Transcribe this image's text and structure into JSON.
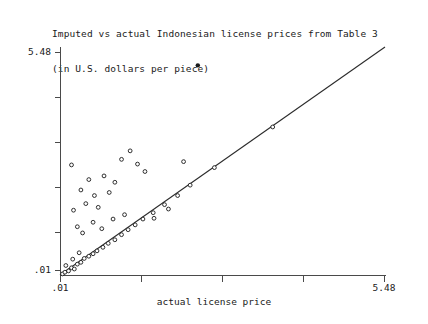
{
  "title": {
    "line1": "Imputed vs actual Indonesian license prices from Table 3",
    "line2": "(in U.S. dollars per piece)"
  },
  "axes": {
    "x_label": "actual license price",
    "y_min_label": ".01",
    "y_max_label": "5.48",
    "x_min_label": ".01",
    "x_max_label": "5.48"
  },
  "chart_data": {
    "type": "scatter",
    "title": "Imputed vs actual Indonesian license prices from Table 3 (in U.S. dollars per piece)",
    "xlabel": "actual license price",
    "ylabel": "",
    "xlim": [
      0.01,
      5.48
    ],
    "ylim": [
      0.01,
      5.48
    ],
    "scale": "log",
    "grid": false,
    "legend": null,
    "tick_labels": {
      "x": [
        ".01",
        "5.48"
      ],
      "y": [
        ".01",
        "5.48"
      ]
    },
    "reference_line": {
      "name": "45-degree identity line",
      "from": [
        0.01,
        0.01
      ],
      "to": [
        5.48,
        5.48
      ]
    },
    "marker_style": "open circle",
    "points": [
      {
        "x": 0.0105,
        "y": 0.0103
      },
      {
        "x": 0.011,
        "y": 0.0108
      },
      {
        "x": 0.0118,
        "y": 0.0112
      },
      {
        "x": 0.0112,
        "y": 0.013
      },
      {
        "x": 0.0125,
        "y": 0.0122
      },
      {
        "x": 0.0132,
        "y": 0.0118
      },
      {
        "x": 0.014,
        "y": 0.0135
      },
      {
        "x": 0.0128,
        "y": 0.0155
      },
      {
        "x": 0.015,
        "y": 0.0142
      },
      {
        "x": 0.016,
        "y": 0.0158
      },
      {
        "x": 0.0145,
        "y": 0.0185
      },
      {
        "x": 0.0175,
        "y": 0.0168
      },
      {
        "x": 0.019,
        "y": 0.018
      },
      {
        "x": 0.0205,
        "y": 0.0195
      },
      {
        "x": 0.023,
        "y": 0.0215
      },
      {
        "x": 0.0255,
        "y": 0.024
      },
      {
        "x": 0.029,
        "y": 0.0265
      },
      {
        "x": 0.033,
        "y": 0.0305
      },
      {
        "x": 0.0375,
        "y": 0.035
      },
      {
        "x": 0.043,
        "y": 0.04
      },
      {
        "x": 0.05,
        "y": 0.047
      },
      {
        "x": 0.061,
        "y": 0.056
      },
      {
        "x": 0.076,
        "y": 0.07
      },
      {
        "x": 0.098,
        "y": 0.09
      },
      {
        "x": 0.0155,
        "y": 0.032
      },
      {
        "x": 0.014,
        "y": 0.038
      },
      {
        "x": 0.019,
        "y": 0.043
      },
      {
        "x": 0.0225,
        "y": 0.036
      },
      {
        "x": 0.013,
        "y": 0.06
      },
      {
        "x": 0.0165,
        "y": 0.072
      },
      {
        "x": 0.021,
        "y": 0.065
      },
      {
        "x": 0.0195,
        "y": 0.09
      },
      {
        "x": 0.015,
        "y": 0.105
      },
      {
        "x": 0.026,
        "y": 0.098
      },
      {
        "x": 0.0175,
        "y": 0.14
      },
      {
        "x": 0.0235,
        "y": 0.155
      },
      {
        "x": 0.029,
        "y": 0.13
      },
      {
        "x": 0.0125,
        "y": 0.21
      },
      {
        "x": 0.033,
        "y": 0.245
      },
      {
        "x": 0.045,
        "y": 0.215
      },
      {
        "x": 0.052,
        "y": 0.175
      },
      {
        "x": 0.039,
        "y": 0.31
      },
      {
        "x": 0.11,
        "y": 0.23
      },
      {
        "x": 0.2,
        "y": 0.195
      },
      {
        "x": 0.028,
        "y": 0.047
      },
      {
        "x": 0.035,
        "y": 0.053
      },
      {
        "x": 0.062,
        "y": 0.048
      },
      {
        "x": 0.082,
        "y": 0.062
      },
      {
        "x": 0.125,
        "y": 0.12
      },
      {
        "x": 0.62,
        "y": 0.6
      },
      {
        "x": 0.145,
        "y": 3.3
      }
    ],
    "notable_points": [
      {
        "label": "high outlier",
        "x": 0.145,
        "y": 3.3
      },
      {
        "label": "on-line point",
        "x": 0.62,
        "y": 0.6
      }
    ],
    "n_points": 52
  }
}
